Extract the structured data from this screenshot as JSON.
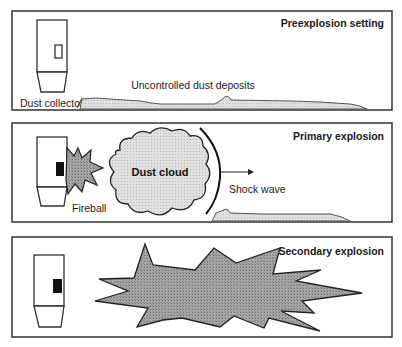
{
  "panels": [
    {
      "title": "Preexplosion setting",
      "labels": {
        "collector": "Dust collector",
        "deposits": "Uncontrolled dust deposits"
      }
    },
    {
      "title": "Primary explosion",
      "labels": {
        "fireball": "Fireball",
        "cloud": "Dust cloud",
        "shock": "Shock wave"
      }
    },
    {
      "title": "Secondary explosion"
    }
  ],
  "colors": {
    "stroke": "#333333",
    "fill_gray": "#a8a8a8",
    "deposit_fill": "#d4d4d4",
    "cloud_fill": "#d9d9d9",
    "dark_block": "#111111"
  }
}
